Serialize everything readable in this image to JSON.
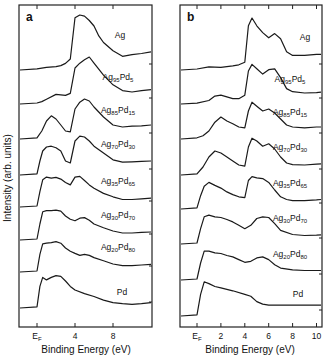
{
  "figure": {
    "ylabel": "Intensity (arb. units)",
    "xlabel": "Binding Energy (eV)"
  },
  "chart_data": [
    {
      "type": "line",
      "panel": "a",
      "title": "a",
      "xlabel": "Binding Energy (eV)",
      "ylabel": "Intensity (arb. units)",
      "xticks": [
        "E_F",
        "4",
        "8"
      ],
      "xtick_values": [
        0,
        4,
        8
      ],
      "xlim": [
        -2,
        12
      ],
      "grid": false,
      "legend": "inline labels at right of each trace",
      "series": [
        {
          "name": "Ag",
          "main": "Ag",
          "sub1": "",
          "el2": "",
          "sub2": "",
          "x": [
            -2,
            0,
            1,
            2,
            2.5,
            3,
            3.5,
            4,
            4.5,
            5,
            5.5,
            6,
            6.5,
            7,
            8,
            9,
            10,
            11,
            12
          ],
          "y": [
            0,
            0.02,
            0.05,
            0.06,
            0.08,
            0.12,
            0.2,
            0.95,
            1.0,
            0.98,
            0.9,
            0.8,
            0.62,
            0.5,
            0.35,
            0.25,
            0.28,
            0.3,
            0.33
          ]
        },
        {
          "name": "Ag95Pd5",
          "main": "Ag",
          "sub1": "95",
          "el2": "Pd",
          "sub2": "5",
          "x": [
            -2,
            0,
            0.5,
            1,
            2,
            3,
            3.5,
            4,
            4.5,
            5,
            5.5,
            6,
            7,
            8,
            9,
            10,
            11,
            12
          ],
          "y": [
            0,
            0.02,
            0.05,
            0.1,
            0.2,
            0.18,
            0.22,
            0.75,
            0.85,
            0.92,
            0.98,
            0.85,
            0.6,
            0.4,
            0.28,
            0.25,
            0.28,
            0.3
          ]
        },
        {
          "name": "Ag85Pd15",
          "main": "Ag",
          "sub1": "85",
          "el2": "Pd",
          "sub2": "15",
          "x": [
            -2,
            0,
            0.5,
            1,
            1.5,
            2,
            2.5,
            3,
            3.5,
            4,
            4.5,
            5,
            5.5,
            6,
            7,
            8,
            9,
            10,
            11,
            12
          ],
          "y": [
            0,
            0.03,
            0.2,
            0.45,
            0.58,
            0.5,
            0.35,
            0.2,
            0.18,
            0.75,
            0.92,
            1.0,
            0.95,
            0.8,
            0.55,
            0.35,
            0.3,
            0.32,
            0.33,
            0.35
          ]
        },
        {
          "name": "Ag70Pd30",
          "main": "Ag",
          "sub1": "70",
          "el2": "Pd",
          "sub2": "30",
          "x": [
            -2,
            0,
            0.3,
            0.6,
            1,
            1.5,
            2,
            2.5,
            3,
            3.5,
            4,
            4.5,
            5,
            5.5,
            6,
            7,
            8,
            9,
            10,
            11,
            12
          ],
          "y": [
            0,
            0.03,
            0.35,
            0.6,
            0.7,
            0.72,
            0.68,
            0.6,
            0.35,
            0.3,
            0.85,
            0.97,
            0.95,
            0.85,
            0.72,
            0.55,
            0.38,
            0.32,
            0.33,
            0.34,
            0.35
          ]
        },
        {
          "name": "Ag35Pd65",
          "main": "Ag",
          "sub1": "35",
          "el2": "Pd",
          "sub2": "65",
          "x": [
            -2,
            0,
            0.3,
            0.6,
            1,
            1.5,
            2,
            2.5,
            3,
            3.5,
            4,
            4.5,
            5,
            5.5,
            6,
            7,
            8,
            9,
            10,
            11,
            12
          ],
          "y": [
            0,
            0.03,
            0.45,
            0.8,
            0.88,
            0.85,
            0.87,
            0.82,
            0.72,
            0.65,
            0.88,
            0.9,
            0.78,
            0.65,
            0.55,
            0.4,
            0.3,
            0.22,
            0.22,
            0.24,
            0.26
          ]
        },
        {
          "name": "Ag30Pd70",
          "main": "Ag",
          "sub1": "30",
          "el2": "Pd",
          "sub2": "70",
          "x": [
            -2,
            0,
            0.3,
            0.6,
            1,
            1.5,
            2,
            2.5,
            3,
            3.5,
            4,
            4.5,
            5,
            5.5,
            6,
            7,
            8,
            9,
            10,
            11,
            12
          ],
          "y": [
            0,
            0.03,
            0.5,
            0.88,
            0.92,
            0.92,
            0.93,
            0.9,
            0.75,
            0.65,
            0.6,
            0.68,
            0.7,
            0.62,
            0.5,
            0.38,
            0.28,
            0.22,
            0.22,
            0.24,
            0.25
          ]
        },
        {
          "name": "Ag20Pd80",
          "main": "Ag",
          "sub1": "20",
          "el2": "Pd",
          "sub2": "80",
          "x": [
            -2,
            0,
            0.3,
            0.6,
            1,
            1.5,
            2,
            2.5,
            3,
            3.5,
            4,
            4.5,
            5,
            5.5,
            6,
            7,
            8,
            9,
            10,
            11,
            12
          ],
          "y": [
            0,
            0.03,
            0.55,
            0.88,
            0.9,
            0.92,
            0.95,
            0.9,
            0.75,
            0.65,
            0.58,
            0.52,
            0.55,
            0.52,
            0.45,
            0.35,
            0.25,
            0.2,
            0.2,
            0.22,
            0.24
          ]
        },
        {
          "name": "Pd",
          "main": "Pd",
          "sub1": "",
          "el2": "",
          "sub2": "",
          "x": [
            -2,
            0,
            0.3,
            0.6,
            1,
            1.5,
            2,
            2.5,
            3,
            3.5,
            4,
            5,
            6,
            7,
            8,
            9,
            10,
            11,
            12
          ],
          "y": [
            0,
            0.03,
            0.6,
            0.85,
            0.78,
            0.85,
            0.9,
            0.88,
            0.75,
            0.6,
            0.5,
            0.4,
            0.32,
            0.22,
            0.15,
            0.12,
            0.1,
            0.12,
            0.15
          ]
        }
      ]
    },
    {
      "type": "line",
      "panel": "b",
      "title": "b",
      "xlabel": "Binding Energy (eV)",
      "ylabel": "Intensity (arb. units)",
      "xticks": [
        "E_F",
        "2",
        "4",
        "6",
        "8",
        "10"
      ],
      "xtick_values": [
        0,
        2,
        4,
        6,
        8,
        10
      ],
      "xlim": [
        -1.5,
        10.5
      ],
      "grid": false,
      "legend": "inline labels at right of each trace",
      "series": [
        {
          "name": "Ag",
          "main": "Ag",
          "sub1": "",
          "el2": "",
          "sub2": "",
          "x": [
            -1.5,
            0,
            1,
            2,
            3,
            3.5,
            4,
            4.3,
            4.6,
            5,
            5.5,
            6,
            6.5,
            7,
            7.5,
            8,
            9,
            10,
            10.5
          ],
          "y": [
            0,
            0.02,
            0.06,
            0.05,
            0.08,
            0.1,
            0.15,
            0.85,
            1.0,
            0.85,
            0.72,
            0.62,
            0.7,
            0.6,
            0.35,
            0.28,
            0.28,
            0.3,
            0.3
          ]
        },
        {
          "name": "Ag95Pd5",
          "main": "Ag",
          "sub1": "95",
          "el2": "Pd",
          "sub2": "5",
          "x": [
            -1.5,
            0,
            1,
            1.5,
            2,
            3,
            3.5,
            4,
            4.3,
            4.6,
            5,
            5.5,
            6,
            6.5,
            7,
            7.5,
            8,
            9,
            10,
            10.5
          ],
          "y": [
            0,
            0.02,
            0.08,
            0.18,
            0.2,
            0.12,
            0.12,
            0.2,
            0.75,
            0.9,
            0.8,
            0.68,
            0.78,
            0.8,
            0.6,
            0.35,
            0.28,
            0.25,
            0.26,
            0.27
          ]
        },
        {
          "name": "Ag85Pd15",
          "main": "Ag",
          "sub1": "85",
          "el2": "Pd",
          "sub2": "15",
          "x": [
            -1.5,
            0,
            0.5,
            1,
            1.5,
            2,
            2.5,
            3,
            3.5,
            4,
            4.3,
            4.6,
            5,
            5.5,
            6,
            6.5,
            7,
            7.5,
            8,
            9,
            10,
            10.5
          ],
          "y": [
            0,
            0.03,
            0.08,
            0.2,
            0.42,
            0.55,
            0.45,
            0.38,
            0.3,
            0.28,
            0.7,
            0.92,
            0.82,
            0.7,
            0.75,
            0.65,
            0.5,
            0.35,
            0.3,
            0.28,
            0.3,
            0.3
          ]
        },
        {
          "name": "Ag70Pd30",
          "main": "Ag",
          "sub1": "70",
          "el2": "Pd",
          "sub2": "30",
          "x": [
            -1.5,
            0,
            0.5,
            1,
            1.5,
            2,
            2.5,
            3,
            3.5,
            4,
            4.3,
            4.6,
            5,
            5.5,
            6,
            6.5,
            7,
            7.5,
            8,
            9,
            10,
            10.5
          ],
          "y": [
            0,
            0.03,
            0.2,
            0.45,
            0.6,
            0.55,
            0.45,
            0.35,
            0.25,
            0.22,
            0.7,
            0.92,
            0.85,
            0.72,
            0.78,
            0.65,
            0.45,
            0.3,
            0.26,
            0.25,
            0.27,
            0.28
          ]
        },
        {
          "name": "Ag35Pd65",
          "main": "Ag",
          "sub1": "35",
          "el2": "Pd",
          "sub2": "65",
          "x": [
            -1.5,
            0,
            0.3,
            0.6,
            1,
            1.5,
            2,
            2.5,
            3,
            3.5,
            4,
            4.3,
            4.6,
            5,
            5.5,
            6,
            6.5,
            7,
            7.5,
            8,
            9,
            10,
            10.5
          ],
          "y": [
            0,
            0.03,
            0.35,
            0.6,
            0.7,
            0.62,
            0.55,
            0.45,
            0.38,
            0.32,
            0.3,
            0.75,
            0.85,
            0.82,
            0.8,
            0.7,
            0.5,
            0.32,
            0.25,
            0.22,
            0.22,
            0.24,
            0.25
          ]
        },
        {
          "name": "Ag30Pd70",
          "main": "Ag",
          "sub1": "30",
          "el2": "Pd",
          "sub2": "70",
          "x": [
            -1.5,
            0,
            0.3,
            0.6,
            1,
            1.5,
            2,
            2.5,
            3,
            3.5,
            4,
            4.5,
            5,
            5.5,
            6,
            6.5,
            7,
            8,
            9,
            10,
            10.5
          ],
          "y": [
            0,
            0.03,
            0.45,
            0.8,
            0.85,
            0.8,
            0.78,
            0.72,
            0.65,
            0.55,
            0.45,
            0.55,
            0.75,
            0.8,
            0.78,
            0.6,
            0.4,
            0.28,
            0.25,
            0.26,
            0.27
          ]
        },
        {
          "name": "Ag20Pd80",
          "main": "Ag",
          "sub1": "20",
          "el2": "Pd",
          "sub2": "80",
          "x": [
            -1.5,
            0,
            0.3,
            0.6,
            1,
            1.5,
            2,
            2.5,
            3,
            3.5,
            4,
            4.5,
            5,
            5.5,
            6,
            6.5,
            7,
            8,
            9,
            10,
            10.5
          ],
          "y": [
            0,
            0.03,
            0.5,
            0.85,
            0.85,
            0.8,
            0.78,
            0.72,
            0.68,
            0.6,
            0.52,
            0.55,
            0.65,
            0.68,
            0.6,
            0.45,
            0.35,
            0.3,
            0.28,
            0.28,
            0.28
          ]
        },
        {
          "name": "Pd",
          "main": "Pd",
          "sub1": "",
          "el2": "",
          "sub2": "",
          "x": [
            -1.5,
            0,
            0.3,
            0.6,
            1,
            1.5,
            2,
            3,
            4,
            4.5,
            5,
            5.5,
            6,
            7,
            8,
            9,
            10,
            10.5
          ],
          "y": [
            0,
            0.03,
            0.6,
            0.95,
            0.9,
            0.82,
            0.78,
            0.7,
            0.6,
            0.55,
            0.4,
            0.33,
            0.3,
            0.3,
            0.3,
            0.3,
            0.3,
            0.3
          ]
        }
      ]
    }
  ]
}
